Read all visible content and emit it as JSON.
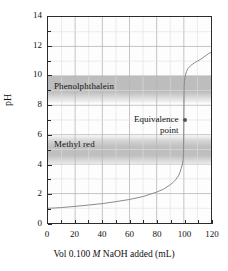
{
  "figure": {
    "y_axis_title": "pH",
    "x_axis_title_pre": "Vol 0.100 ",
    "x_axis_title_italic": "M",
    "x_axis_title_post": " NaOH added (mL)"
  },
  "annotations": {
    "equivalence_line1": "Equivalence",
    "equivalence_line2": "point",
    "equivalence_dot": "equivalence-point-marker"
  },
  "bands": [
    {
      "label": "Phenolphthalein",
      "low": 8.2,
      "high": 10.0,
      "color": "#969696"
    },
    {
      "label": "Methyl red",
      "low": 4.2,
      "high": 6.0,
      "color": "#969696"
    }
  ],
  "chart_data": {
    "type": "line",
    "title": "",
    "xlabel": "Vol 0.100 M NaOH added (mL)",
    "ylabel": "pH",
    "xlim": [
      0,
      120
    ],
    "ylim": [
      0,
      14
    ],
    "xticks": [
      0,
      20,
      40,
      60,
      80,
      100,
      120
    ],
    "xtick_minor_step": 10,
    "yticks": [
      0,
      2,
      4,
      6,
      8,
      10,
      12,
      14
    ],
    "ytick_minor_step": 1,
    "grid": true,
    "grid_x_step": 10,
    "grid_y_step": 1,
    "legend": "none",
    "curve_color": "#8a8a8a",
    "series": [
      {
        "name": "Titration of strong acid with 0.100 M NaOH",
        "x": [
          0,
          5,
          10,
          20,
          30,
          40,
          50,
          60,
          70,
          75,
          80,
          85,
          90,
          92,
          94,
          96,
          97,
          98,
          99,
          99.5,
          99.8,
          100,
          100.2,
          100.5,
          101,
          102,
          103,
          105,
          108,
          110,
          112,
          115,
          118,
          120
        ],
        "y": [
          1.0,
          1.02,
          1.05,
          1.13,
          1.22,
          1.32,
          1.45,
          1.6,
          1.8,
          1.95,
          2.1,
          2.3,
          2.6,
          2.75,
          2.95,
          3.2,
          3.4,
          3.7,
          4.0,
          4.3,
          4.8,
          7.0,
          9.2,
          9.7,
          10.0,
          10.3,
          10.5,
          10.7,
          10.9,
          11.0,
          11.1,
          11.3,
          11.5,
          11.6
        ]
      }
    ],
    "annotations": [
      {
        "label": "Equivalence point",
        "x": 100,
        "y": 7.0
      },
      {
        "label": "Phenolphthalein",
        "band_low": 8.2,
        "band_high": 10.0
      },
      {
        "label": "Methyl red",
        "band_low": 4.2,
        "band_high": 6.0
      }
    ]
  },
  "axis_labels": {
    "y": [
      "0",
      "2",
      "4",
      "6",
      "8",
      "10",
      "12",
      "14"
    ],
    "x": [
      "0",
      "20",
      "40",
      "60",
      "80",
      "100",
      "120"
    ]
  }
}
